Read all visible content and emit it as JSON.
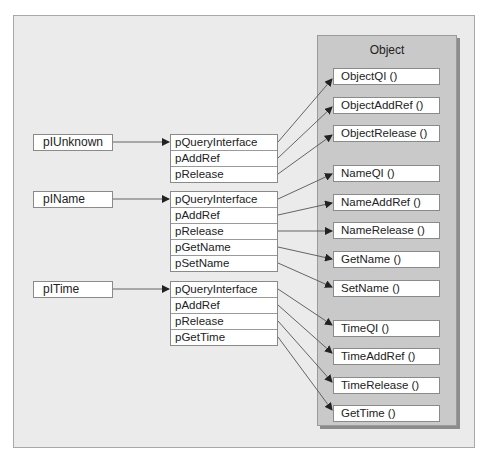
{
  "object": {
    "title": "Object",
    "methods": [
      "ObjectQI ()",
      "ObjectAddRef ()",
      "ObjectRelease ()",
      "NameQI ()",
      "NameAddRef ()",
      "NameRelease ()",
      "GetName ()",
      "SetName ()",
      "TimeQI ()",
      "TimeAddRef ()",
      "TimeRelease ()",
      "GetTime ()"
    ]
  },
  "interfaces": [
    {
      "pointer": "pIUnknown",
      "vtable": [
        "pQueryInterface",
        "pAddRef",
        "pRelease"
      ]
    },
    {
      "pointer": "pIName",
      "vtable": [
        "pQueryInterface",
        "pAddRef",
        "pRelease",
        "pGetName",
        "pSetName"
      ]
    },
    {
      "pointer": "pITime",
      "vtable": [
        "pQueryInterface",
        "pAddRef",
        "pRelease",
        "pGetTime"
      ]
    }
  ],
  "colors": {
    "panel_bg": "#ebebeb",
    "object_bg": "#c9c9c9",
    "line": "#555555"
  }
}
